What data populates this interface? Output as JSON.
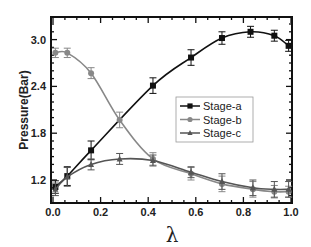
{
  "chart_data": {
    "type": "line",
    "title": "",
    "xlabel": "λ",
    "ylabel": "Pressure(Bar)",
    "xlim": [
      0.0,
      1.0
    ],
    "ylim": [
      0.97,
      3.35
    ],
    "xticks": [
      "0.0",
      "0.2",
      "0.4",
      "0.6",
      "0.8",
      "1.0"
    ],
    "yticks": [
      "1.2",
      "1.8",
      "2.4",
      "3.0"
    ],
    "grid": false,
    "legend_position": "center-right",
    "series": [
      {
        "name": "Stage-a",
        "color": "#111111",
        "marker": "square",
        "x": [
          0.01,
          0.06,
          0.16,
          0.42,
          0.58,
          0.71,
          0.83,
          0.93,
          0.99
        ],
        "values": [
          1.11,
          1.25,
          1.58,
          2.41,
          2.77,
          3.02,
          3.1,
          3.05,
          2.92
        ],
        "error": [
          0.08,
          0.12,
          0.12,
          0.1,
          0.1,
          0.08,
          0.07,
          0.07,
          0.07
        ]
      },
      {
        "name": "Stage-b",
        "color": "#888888",
        "marker": "circle",
        "x": [
          0.01,
          0.06,
          0.16,
          0.28,
          0.42,
          0.58,
          0.71,
          0.84,
          0.93,
          0.99
        ],
        "values": [
          2.83,
          2.83,
          2.57,
          1.97,
          1.47,
          1.28,
          1.15,
          1.08,
          1.05,
          1.05
        ],
        "error": [
          0.06,
          0.06,
          0.07,
          0.1,
          0.08,
          0.08,
          0.1,
          0.1,
          0.08,
          0.07
        ]
      },
      {
        "name": "Stage-c",
        "color": "#555555",
        "marker": "triangle",
        "x": [
          0.01,
          0.06,
          0.16,
          0.28,
          0.42,
          0.58,
          0.71,
          0.84,
          0.93,
          0.99
        ],
        "values": [
          1.08,
          1.24,
          1.4,
          1.47,
          1.45,
          1.3,
          1.18,
          1.1,
          1.08,
          1.08
        ],
        "error": [
          0.08,
          0.12,
          0.07,
          0.07,
          0.07,
          0.07,
          0.1,
          0.1,
          0.1,
          0.1
        ]
      }
    ]
  }
}
